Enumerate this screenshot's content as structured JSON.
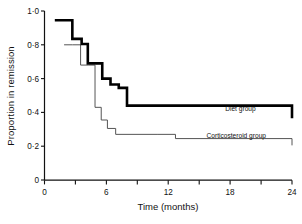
{
  "chart_data": {
    "type": "line",
    "title": "",
    "subtitle": "",
    "xlabel": "Time (months)",
    "ylabel": "Proportion in remission",
    "xlim": [
      0,
      24
    ],
    "ylim": [
      0,
      1.0
    ],
    "grid": false,
    "legend_position": "inline-right-of-curves",
    "x_ticks_major": [
      0,
      6,
      12,
      18,
      24
    ],
    "x_ticks_major_labels": [
      "0",
      "6",
      "12",
      "18",
      "24"
    ],
    "x_ticks_minor": [
      3,
      9,
      15,
      21
    ],
    "y_ticks": [
      0,
      0.2,
      0.4,
      0.6,
      0.8,
      1.0
    ],
    "y_tick_labels": [
      "0",
      "0·2",
      "0·4",
      "0·6",
      "0·8",
      "1·0"
    ],
    "step_type": "post",
    "series": [
      {
        "name": "Diet group",
        "label": "Diet group",
        "color": "#000000",
        "line_width": 2.6,
        "x": [
          1.0,
          2.0,
          2.7,
          3.6,
          4.2,
          4.9,
          5.6,
          6.4,
          7.2,
          8.0,
          12.7,
          24.0
        ],
        "y": [
          0.945,
          0.945,
          0.835,
          0.805,
          0.69,
          0.69,
          0.6,
          0.565,
          0.545,
          0.44,
          0.44,
          0.365
        ],
        "values": [
          0.945,
          0.945,
          0.835,
          0.805,
          0.69,
          0.69,
          0.6,
          0.565,
          0.545,
          0.44,
          0.44,
          0.365
        ],
        "final_value": 0.365
      },
      {
        "name": "Corticosteroid group",
        "label": "Corticosteroid group",
        "color": "#555555",
        "line_width": 1.0,
        "x": [
          1.9,
          2.7,
          3.5,
          4.3,
          4.9,
          5.5,
          6.1,
          6.9,
          11.0,
          12.7,
          24.0
        ],
        "y": [
          0.8,
          0.8,
          0.68,
          0.68,
          0.43,
          0.355,
          0.305,
          0.27,
          0.27,
          0.245,
          0.205
        ],
        "values": [
          0.8,
          0.8,
          0.68,
          0.68,
          0.43,
          0.355,
          0.305,
          0.27,
          0.27,
          0.245,
          0.205
        ],
        "final_value": 0.205
      }
    ],
    "annotations": [
      {
        "text": "Diet group",
        "x": 19.0,
        "y": 0.41
      },
      {
        "text": "Corticosteroid group",
        "x": 18.6,
        "y": 0.25
      }
    ]
  },
  "axes": {
    "ylabel": "Proportion in remission",
    "xlabel": "Time (months)",
    "y_tick_labels": [
      "1·0",
      "0·8",
      "0·6",
      "0·4",
      "0·2",
      "0"
    ],
    "x_tick_labels": [
      "0",
      "6",
      "12",
      "18",
      "24"
    ]
  },
  "legend": {
    "diet_label": "Diet group",
    "steroid_label": "Corticosteroid group"
  }
}
